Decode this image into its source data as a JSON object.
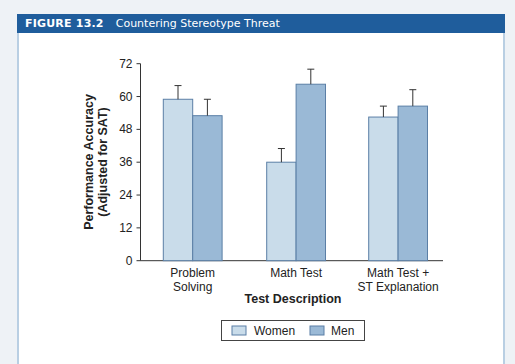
{
  "figure": {
    "number": "FIGURE 13.2",
    "title": "Countering Stereotype Threat"
  },
  "colors": {
    "header_bg": "#1f5d9c",
    "women_fill": "#c9dcea",
    "men_fill": "#9ab9d6",
    "bar_stroke": "#5b7fa6"
  },
  "chart_data": {
    "type": "bar",
    "title": "Countering Stereotype Threat",
    "xlabel": "Test Description",
    "ylabel": [
      "Performance Accuracy",
      "(Adjusted for SAT)"
    ],
    "ylim": [
      0,
      72
    ],
    "yticks": [
      0,
      12,
      24,
      36,
      48,
      60,
      72
    ],
    "grid": false,
    "legend_position": "bottom",
    "categories": [
      [
        "Problem",
        "Solving"
      ],
      [
        "Math Test"
      ],
      [
        "Math Test +",
        "ST Explanation"
      ]
    ],
    "series": [
      {
        "name": "Women",
        "values": [
          59,
          36,
          52.5
        ],
        "error_upper": [
          64,
          41,
          56.5
        ]
      },
      {
        "name": "Men",
        "values": [
          53,
          64.5,
          56.5
        ],
        "error_upper": [
          59,
          70,
          62.5
        ]
      }
    ]
  },
  "legend": {
    "women": "Women",
    "men": "Men"
  }
}
